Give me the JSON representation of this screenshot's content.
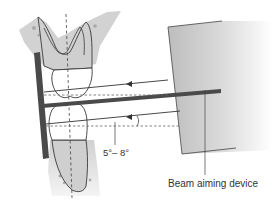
{
  "diagram": {
    "labels": {
      "angle": "5°– 8°",
      "device": "Beam aiming device"
    },
    "colors": {
      "bone": "#d4d4d4",
      "bone_dark": "#a8a8a8",
      "tooth_root": "#cfcfcf",
      "crown": "#ffffff",
      "outline": "#3a3a3a",
      "bar": "#4a4a4a",
      "device_gradient_start": "#bdbdbd",
      "device_gradient_end": "#ffffff",
      "dashed": "#555555"
    },
    "parts": [
      "maxillary-tooth",
      "mandibular-tooth",
      "film-holder",
      "indicator-rod",
      "beam-aiming-device",
      "central-ray-upper",
      "central-ray-lower",
      "long-axis-dashed-line",
      "perpendicular-dashed-lines"
    ]
  }
}
